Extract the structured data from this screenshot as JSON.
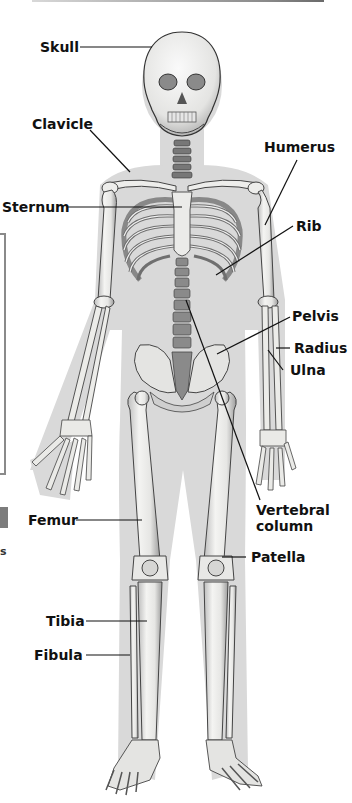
{
  "diagram": {
    "labels": {
      "skull": "Skull",
      "clavicle": "Clavicle",
      "sternum": "Sternum",
      "humerus": "Humerus",
      "rib": "Rib",
      "pelvis": "Pelvis",
      "radius": "Radius",
      "ulna": "Ulna",
      "vertebral_column_line1": "Vertebral",
      "vertebral_column_line2": "column",
      "femur": "Femur",
      "patella": "Patella",
      "tibia": "Tibia",
      "fibula": "Fibula"
    },
    "partial_text": {
      "left_edge_char": "s"
    },
    "colors": {
      "silhouette": "#d6d6d6",
      "bone": "#f2f2f0",
      "bone_outline": "#555555",
      "bone_shade": "#9a9a9a",
      "leader_line": "#111111",
      "label_text": "#111111"
    }
  }
}
